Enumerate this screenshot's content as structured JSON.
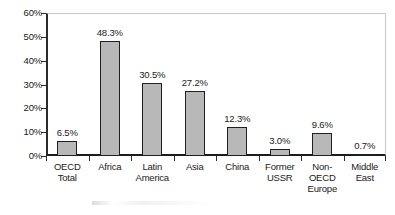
{
  "chart_data": {
    "type": "bar",
    "title": "",
    "subtitle": "",
    "xlabel": "",
    "ylabel": "",
    "ylim": [
      0,
      60
    ],
    "grid": false,
    "legend": "none",
    "y_tick_labels": [
      "60%",
      "50%",
      "40%",
      "30%",
      "20%",
      "10%",
      "0%"
    ],
    "y_tick_values": [
      60,
      50,
      40,
      30,
      20,
      10,
      0
    ],
    "categories": [
      "OECD Total",
      "Africa",
      "Latin America",
      "Asia",
      "China",
      "Former USSR",
      "Non-OECD Europe",
      "Middle East"
    ],
    "category_label_lines": [
      [
        "OECD",
        "Total"
      ],
      [
        "Africa"
      ],
      [
        "Latin",
        "America"
      ],
      [
        "Asia"
      ],
      [
        "China"
      ],
      [
        "Former",
        "USSR"
      ],
      [
        "Non-",
        "OECD",
        "Europe"
      ],
      [
        "Middle",
        "East"
      ]
    ],
    "values": [
      6.5,
      48.3,
      30.5,
      27.2,
      12.3,
      3.0,
      9.6,
      0.7
    ],
    "value_labels": [
      "6.5%",
      "48.3%",
      "30.5%",
      "27.2%",
      "12.3%",
      "3.0%",
      "9.6%",
      "0.7%"
    ],
    "colors": {
      "bar_fill": "#b8b8b8",
      "bar_border": "#1f1f1f",
      "axis": "#1c1c1c",
      "frame": "#c9c9c9",
      "text": "#1a1a1a",
      "background": "#ffffff"
    }
  }
}
